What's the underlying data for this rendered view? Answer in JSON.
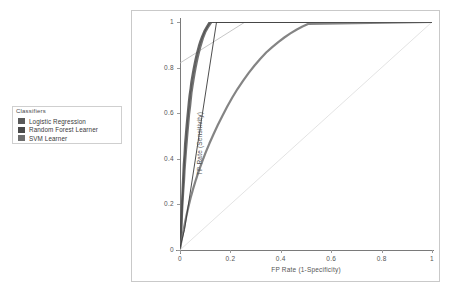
{
  "legend": {
    "title": "Classifiers",
    "items": [
      {
        "label": "Logistic Regression",
        "color": "#5a5a5a"
      },
      {
        "label": "Random Forest Learner",
        "color": "#4a4a4a"
      },
      {
        "label": "SVM Learner",
        "color": "#6e6e6e"
      }
    ]
  },
  "chart_data": {
    "type": "line",
    "title": "",
    "xlabel": "FP Rate (1-Specificity)",
    "ylabel": "TP Rate (Sensitivity)",
    "xlim": [
      0,
      1
    ],
    "ylim": [
      0,
      1
    ],
    "grid": false,
    "legend_position": "left-outside",
    "xticks": [
      "0",
      "0.2",
      "0.4",
      "0.6",
      "0.8",
      "1"
    ],
    "yticks": [
      "0",
      "0.2",
      "0.4",
      "0.6",
      "0.8",
      "1"
    ],
    "xtick_values": [
      0,
      0.2,
      0.4,
      0.6,
      0.8,
      1
    ],
    "ytick_values": [
      0,
      0.2,
      0.4,
      0.6,
      0.8,
      1
    ],
    "reference_line": {
      "name": "chance-diagonal",
      "x": [
        0,
        1
      ],
      "y": [
        0,
        1
      ],
      "color": "#dcdcdc"
    },
    "tangent_line": {
      "name": "tangent-line",
      "x": [
        0.0,
        0.33
      ],
      "y": [
        0.82,
        1.05
      ],
      "color": "#b8b8b8"
    },
    "series": [
      {
        "name": "Logistic Regression",
        "color": "#5a5a5a",
        "x": [
          0.0,
          0.004,
          0.006,
          0.008,
          0.01,
          0.013,
          0.016,
          0.018,
          0.021,
          0.024,
          0.027,
          0.03,
          0.033,
          0.036,
          0.04,
          0.043,
          0.046,
          0.05,
          0.054,
          0.058,
          0.062,
          0.066,
          0.07,
          0.075,
          0.08,
          0.086,
          0.092,
          0.1,
          0.11,
          0.125,
          1.0
        ],
        "y": [
          0.01,
          0.06,
          0.11,
          0.16,
          0.21,
          0.26,
          0.305,
          0.35,
          0.395,
          0.44,
          0.48,
          0.52,
          0.558,
          0.595,
          0.63,
          0.663,
          0.693,
          0.722,
          0.75,
          0.776,
          0.8,
          0.822,
          0.843,
          0.866,
          0.888,
          0.91,
          0.932,
          0.955,
          0.975,
          1.0,
          1.0
        ]
      },
      {
        "name": "Random Forest Learner",
        "color": "#4a4a4a",
        "x": [
          0.0,
          0.003,
          0.005,
          0.007,
          0.009,
          0.011,
          0.013,
          0.015,
          0.018,
          0.02,
          0.023,
          0.026,
          0.029,
          0.032,
          0.035,
          0.038,
          0.042,
          0.045,
          0.049,
          0.053,
          0.057,
          0.061,
          0.065,
          0.07,
          0.075,
          0.081,
          0.088,
          0.096,
          0.106,
          0.118,
          1.0
        ],
        "y": [
          0.012,
          0.07,
          0.125,
          0.18,
          0.232,
          0.282,
          0.33,
          0.376,
          0.42,
          0.463,
          0.503,
          0.542,
          0.578,
          0.613,
          0.647,
          0.678,
          0.708,
          0.736,
          0.762,
          0.787,
          0.81,
          0.832,
          0.852,
          0.874,
          0.895,
          0.916,
          0.937,
          0.958,
          0.978,
          1.0,
          1.0
        ]
      },
      {
        "name": "SVM Learner",
        "color": "#6e6e6e",
        "x": [
          0.0,
          0.006,
          0.012,
          0.018,
          0.025,
          0.033,
          0.042,
          0.052,
          0.063,
          0.075,
          0.088,
          0.102,
          0.117,
          0.133,
          0.15,
          0.168,
          0.187,
          0.207,
          0.228,
          0.25,
          0.272,
          0.295,
          0.318,
          0.342,
          0.366,
          0.39,
          0.414,
          0.438,
          0.462,
          0.486,
          0.51,
          1.0
        ],
        "y": [
          0.008,
          0.04,
          0.075,
          0.11,
          0.148,
          0.188,
          0.228,
          0.268,
          0.308,
          0.348,
          0.388,
          0.428,
          0.468,
          0.508,
          0.548,
          0.588,
          0.628,
          0.668,
          0.706,
          0.742,
          0.776,
          0.808,
          0.838,
          0.866,
          0.89,
          0.912,
          0.932,
          0.95,
          0.966,
          0.98,
          0.992,
          1.0
        ]
      },
      {
        "name": "SVM Linear Segment",
        "color": "#3a3a3a",
        "x": [
          0.0,
          0.018,
          0.145,
          1.0
        ],
        "y": [
          0.01,
          0.09,
          1.0,
          1.0
        ]
      }
    ]
  }
}
